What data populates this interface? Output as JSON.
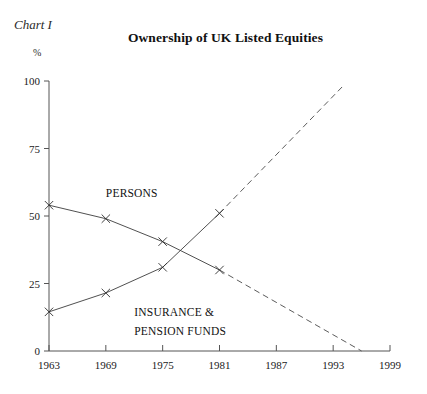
{
  "figure": {
    "chart_number_label": "Chart I",
    "title": "Ownership of UK Listed Equities",
    "unit_label": "%"
  },
  "chart_data": {
    "type": "line",
    "title": "Ownership of UK Listed Equities",
    "xlabel": "",
    "ylabel": "%",
    "xlim": [
      1963,
      1999
    ],
    "ylim": [
      0,
      100
    ],
    "grid": false,
    "legend_position": "inline-annotations",
    "x_ticks": [
      "1963",
      "1969",
      "1975",
      "1981",
      "1987",
      "1993",
      "1999"
    ],
    "y_ticks": [
      "0",
      "25",
      "50",
      "75",
      "100"
    ],
    "series": [
      {
        "name": "PERSONS",
        "label_lines": [
          "PERSONS"
        ],
        "style": "solid-with-markers",
        "x": [
          1963,
          1969,
          1975,
          1981
        ],
        "values": [
          54,
          49,
          40.5,
          30
        ],
        "projection_style": "dashed",
        "projection_x": [
          1981,
          1996
        ],
        "projection_values": [
          30,
          0
        ]
      },
      {
        "name": "INSURANCE & PENSION FUNDS",
        "label_lines": [
          "INSURANCE &",
          "PENSION FUNDS"
        ],
        "style": "solid-with-markers",
        "x": [
          1963,
          1969,
          1975,
          1981
        ],
        "values": [
          14.5,
          21.5,
          31,
          51
        ],
        "projection_style": "dashed",
        "projection_x": [
          1981,
          1994
        ],
        "projection_values": [
          51,
          98
        ]
      }
    ],
    "annotations": [
      {
        "text": "PERSONS",
        "x": 1969,
        "y": 57
      },
      {
        "text": "INSURANCE &",
        "x": 1972,
        "y": 13
      },
      {
        "text": "PENSION FUNDS",
        "x": 1972,
        "y": 6
      }
    ]
  },
  "colors": {
    "axis": "#555555",
    "series_line": "#3c3c3c",
    "projection_line": "#5c5c5c",
    "text": "#1a1a1a",
    "background": "#ffffff"
  }
}
